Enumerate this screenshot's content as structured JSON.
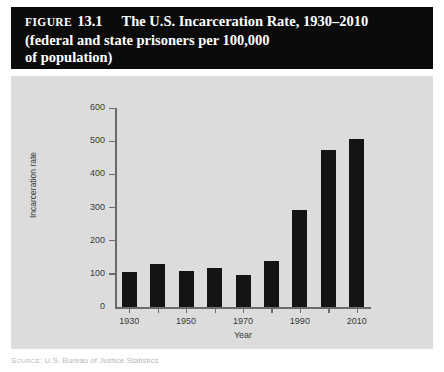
{
  "figure": {
    "label": "Figure",
    "number": "13.1",
    "title_line_1": "The U.S. Incarceration Rate, 1930–2010",
    "title_line_2": "(federal and state prisoners per 100,000",
    "title_line_3": "of population)"
  },
  "source": {
    "label": "Source:",
    "text": "U.S. Bureau of Justice Statistics"
  },
  "colors": {
    "banner_background": "#0b0b0b",
    "banner_text": "#ffffff",
    "panel_background": "#dcdcdc",
    "bar_fill": "#141414",
    "axis_line": "#6b6b6b",
    "tick_text": "#3a3a3a"
  },
  "chart_data": {
    "type": "bar",
    "title": "The U.S. Incarceration Rate, 1930–2010 (federal and state prisoners per 100,000 of population)",
    "xlabel": "Year",
    "ylabel": "Incarceration rate",
    "ylim": [
      0,
      600
    ],
    "yticks": [
      0,
      100,
      200,
      300,
      400,
      500,
      600
    ],
    "ytick_labels": [
      "0",
      "100",
      "200",
      "300",
      "400",
      "500",
      "600"
    ],
    "xticks": [
      1930,
      1940,
      1950,
      1960,
      1970,
      1980,
      1990,
      2000,
      2010
    ],
    "xtick_labels": [
      "1930",
      "",
      "1950",
      "",
      "1970",
      "",
      "1990",
      "",
      "2010"
    ],
    "grid": false,
    "legend": false,
    "categories": [
      "1930",
      "1940",
      "1950",
      "1960",
      "1970",
      "1980",
      "1990",
      "2000",
      "2010"
    ],
    "values": [
      105,
      131,
      109,
      117,
      96,
      139,
      292,
      473,
      507
    ]
  }
}
